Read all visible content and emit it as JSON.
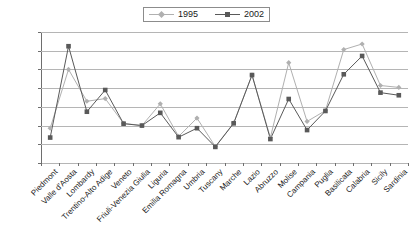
{
  "chart": {
    "type": "line",
    "title": "",
    "legend_position": "top-center"
  },
  "legend": {
    "entries": [
      {
        "label": "1995",
        "color": "#b0b0b0",
        "marker": "diamond"
      },
      {
        "label": "2002",
        "color": "#595959",
        "marker": "square"
      }
    ]
  },
  "yaxis": {
    "ticks": [
      "0.45",
      "0.4",
      "0.35",
      "0.3",
      "0.25",
      "0.2",
      "0.15",
      "0.1"
    ],
    "min": 0.1,
    "max": 0.45,
    "step": 0.05,
    "label": ""
  },
  "xaxis": {
    "label": "",
    "categories": [
      "Piedmont",
      "Valle d'Aosta",
      "Lombardy",
      "Trentino-Alto Adige",
      "Veneto",
      "Friuli-Venezia Giulia",
      "Liguria",
      "Emilia Romagna",
      "Umbria",
      "Tuscany",
      "Marche",
      "Lazio",
      "Abruzzo",
      "Molise",
      "Campania",
      "Puglia",
      "Basilicata",
      "Calabria",
      "Sicily",
      "Sardinia"
    ]
  },
  "chart_data": {
    "type": "line",
    "title": "",
    "xlabel": "",
    "ylabel": "",
    "ylim": [
      0.1,
      0.45
    ],
    "ystep": 0.05,
    "grid": true,
    "legend": "top-center",
    "categories": [
      "Piedmont",
      "Valle d'Aosta",
      "Lombardy",
      "Trentino-Alto Adige",
      "Veneto",
      "Friuli-Venezia Giulia",
      "Liguria",
      "Emilia Romagna",
      "Umbria",
      "Tuscany",
      "Marche",
      "Lazio",
      "Abruzzo",
      "Molise",
      "Campania",
      "Puglia",
      "Basilicata",
      "Calabria",
      "Sicily",
      "Sardinia"
    ],
    "series": [
      {
        "name": "1995",
        "color": "#b0b0b0",
        "marker": "diamond",
        "values": [
          0.193,
          0.35,
          0.265,
          0.272,
          0.206,
          0.2,
          0.258,
          0.171,
          0.22,
          0.144,
          0.207,
          0.335,
          0.168,
          0.368,
          0.211,
          0.24,
          0.403,
          0.418,
          0.307,
          0.302
        ]
      },
      {
        "name": "2002",
        "color": "#595959",
        "marker": "square",
        "values": [
          0.168,
          0.412,
          0.237,
          0.295,
          0.205,
          0.2,
          0.234,
          0.169,
          0.193,
          0.143,
          0.206,
          0.335,
          0.164,
          0.271,
          0.188,
          0.239,
          0.337,
          0.386,
          0.288,
          0.281
        ]
      }
    ]
  }
}
